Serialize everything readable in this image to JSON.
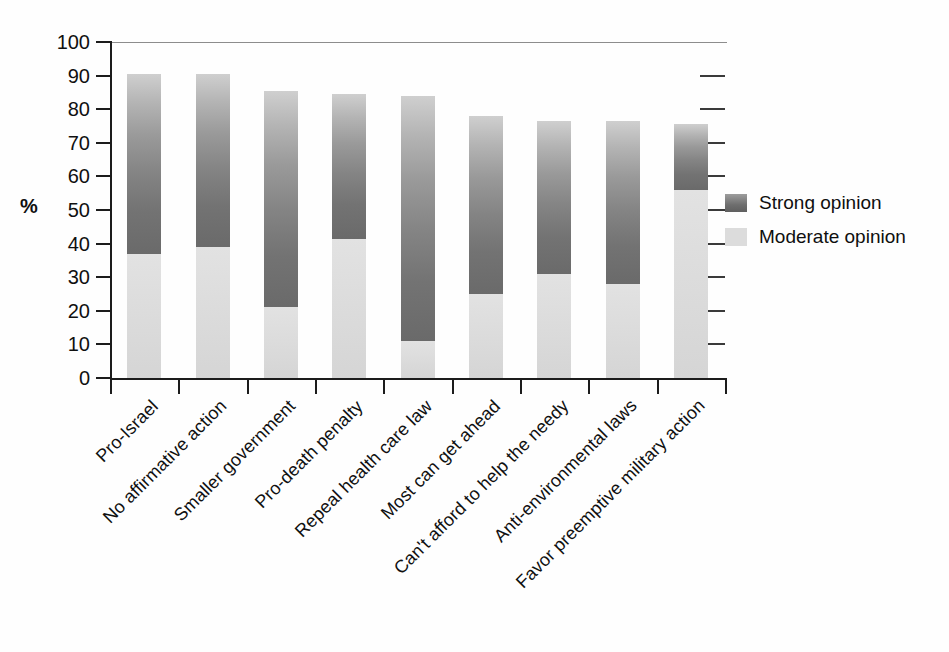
{
  "chart_data": {
    "type": "bar",
    "subtype": "stacked-vertical",
    "title": "",
    "xlabel": "",
    "ylabel": "%",
    "ylim": [
      0,
      100
    ],
    "ytick_values": [
      0,
      10,
      20,
      30,
      40,
      50,
      60,
      70,
      80,
      90,
      100
    ],
    "ytick_labels": [
      "0",
      "10",
      "20",
      "30",
      "40",
      "50",
      "60",
      "70",
      "80",
      "90",
      "100"
    ],
    "grid": false,
    "legend_position": "right",
    "categories": [
      "Pro-Israel",
      "No affirmative action",
      "Smaller government",
      "Pro-death penalty",
      "Repeal health care law",
      "Most can get ahead",
      "Can't afford to help the needy",
      "Anti-environmental laws",
      "Favor preemptive military action"
    ],
    "series": [
      {
        "name": "Moderate opinion",
        "color": "#dcdcdc",
        "values": [
          37,
          39,
          21,
          41.5,
          11,
          25,
          31,
          28,
          56
        ]
      },
      {
        "name": "Strong opinion",
        "color": "#6e6e6e",
        "values": [
          53.5,
          51.5,
          64.5,
          43,
          73,
          53,
          45.5,
          48.5,
          19.5
        ]
      }
    ],
    "totals": [
      90.5,
      90.5,
      85.5,
      84.5,
      84,
      78,
      76.5,
      76.5,
      75.5
    ]
  },
  "axis": {
    "y_title": "%"
  },
  "legend": {
    "entries": [
      {
        "label": "Strong opinion",
        "swatch": "strong"
      },
      {
        "label": "Moderate opinion",
        "swatch": "moderate"
      }
    ]
  }
}
